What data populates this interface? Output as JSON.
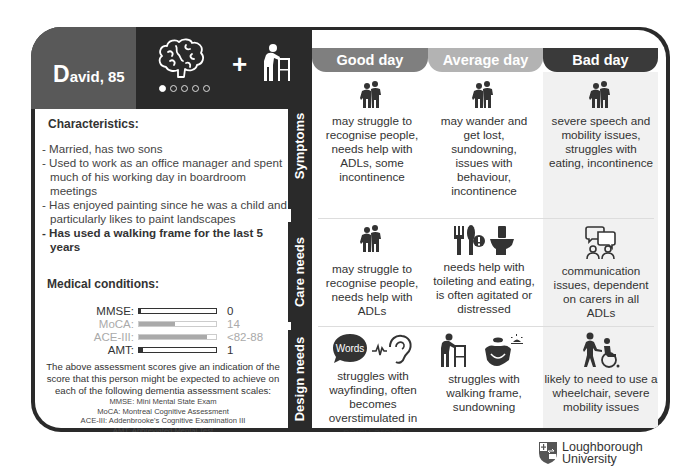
{
  "person": {
    "initial": "D",
    "name_rest": "avid, 85",
    "icons": [
      "brain-icon",
      "plus-icon",
      "walking-frame-icon"
    ],
    "dots": {
      "total": 5,
      "active": 1
    }
  },
  "characteristics": {
    "title": "Characteristics:",
    "items": [
      {
        "text": "- Married, has two sons",
        "bold": false
      },
      {
        "text": "- Used to work as an office manager and spent much of his working day in boardroom meetings",
        "bold": false
      },
      {
        "text": "- Has enjoyed painting since he was a child and particularly likes to paint landscapes",
        "bold": false
      },
      {
        "text": "- Has used a walking frame for the last 5 years",
        "bold": true
      }
    ]
  },
  "medical": {
    "title": "Medical conditions:",
    "scores": [
      {
        "label": "MMSE:",
        "value": "0",
        "fill_fraction": 0.02,
        "dim": false
      },
      {
        "label": "MoCA:",
        "value": "14",
        "fill_fraction": 0.47,
        "dim": true
      },
      {
        "label": "ACE-III:",
        "value": "<82-88",
        "fill_fraction": 0.88,
        "dim": true
      },
      {
        "label": "AMT:",
        "value": "1",
        "fill_fraction": 0.05,
        "dim": false
      }
    ],
    "explanation": "The above assessment scores give an indication of the score that this person might be expected to achieve on each of the following dementia assessment scales:",
    "abbreviations": [
      "MMSE: Mini Mental State Exam",
      "MoCA: Montreal Cognitive Assessment",
      "ACE-III: Addenbrooke's Cognitive Examination III",
      "AMT: Abbreviated Mental Test"
    ]
  },
  "days": [
    {
      "label": "Good day",
      "color": "#7f7f7f"
    },
    {
      "label": "Average day",
      "color": "#b3b3b3"
    },
    {
      "label": "Bad day",
      "color": "#3a3a3a"
    }
  ],
  "rows": [
    {
      "label": "Symptoms",
      "cells": [
        {
          "icon": "people-icon",
          "text": "may struggle to recognise people, needs help with ADLs, some incontinence"
        },
        {
          "icon": "people-icon",
          "text": "may wander and get lost, sundowning, issues with behaviour, incontinence"
        },
        {
          "icon": "people-icon",
          "text": "severe speech and mobility issues, struggles with eating, incontinence"
        }
      ]
    },
    {
      "label": "Care  needs",
      "cells": [
        {
          "icon": "people-icon",
          "text": "may struggle to recognise people, needs help with ADLs"
        },
        {
          "icon": "cutlery-toilet-icon",
          "text": "needs help with toileting and eating, is often agitated or distressed"
        },
        {
          "icon": "speech-bubbles-people-icon",
          "text": "communication issues, dependent on carers in all ADLs"
        }
      ]
    },
    {
      "label": "Design needs",
      "cells": [
        {
          "icon": "words-ear-icon",
          "word_bubble": "Words",
          "text": "struggles with wayfinding, often becomes overstimulated in noisy areas"
        },
        {
          "icon": "walking-frame-sundown-icon",
          "text": "struggles with walking frame, sundowning"
        },
        {
          "icon": "wheelchair-icon",
          "text": "likely to need to use a wheelchair, severe mobility issues"
        }
      ]
    }
  ],
  "logo": {
    "line1": "Loughborough",
    "line2": "University"
  }
}
